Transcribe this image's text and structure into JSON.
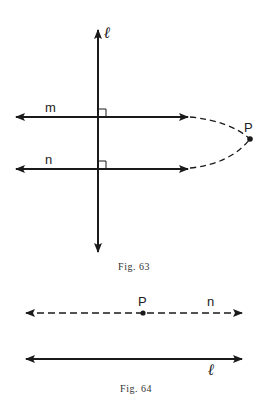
{
  "figures": [
    {
      "caption": "Fig. 63",
      "labels": {
        "line_l": "ℓ",
        "line_m": "m",
        "line_n": "n",
        "point_p": "P"
      },
      "description": "Two lines m and n both perpendicular to vertical line ℓ, dashed extensions meeting at point P"
    },
    {
      "caption": "Fig. 64",
      "labels": {
        "point_p": "P",
        "line_n": "n",
        "line_l": "ℓ"
      },
      "description": "Dashed line n through point P parallel to solid line ℓ"
    }
  ],
  "colors": {
    "stroke": "#1a1a1a",
    "background": "#ffffff"
  }
}
